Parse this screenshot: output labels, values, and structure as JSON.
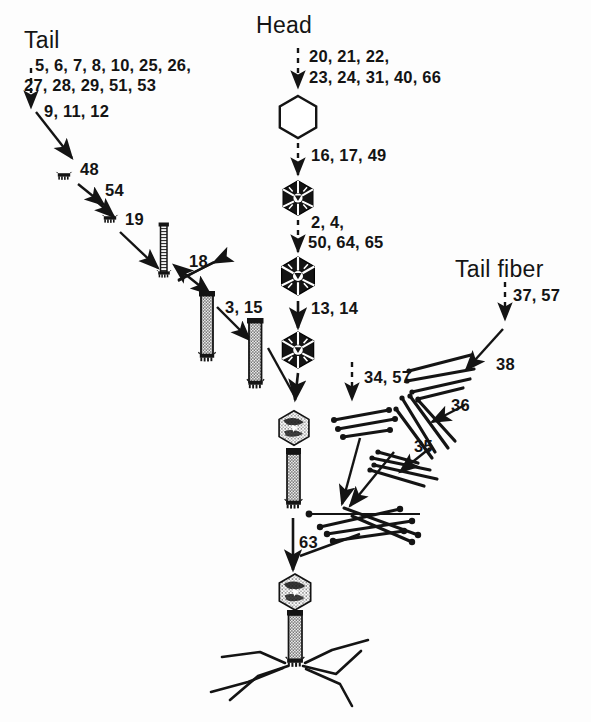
{
  "diagram": {
    "type": "bacteriophage-t4-assembly-pathway",
    "background_color": "#fdfdfd",
    "ink_color": "#141414"
  },
  "headings": {
    "tail": "Tail",
    "head": "Head",
    "tail_fiber": "Tail fiber"
  },
  "pathways": {
    "tail": {
      "step1": "5, 6, 7, 8, 10, 25, 26,",
      "step1b": "27, 28, 29, 51, 53",
      "step2": "9, 11, 12",
      "step3": "48",
      "step4": "54",
      "step5": "19",
      "step6": "18",
      "step7": "3, 15"
    },
    "head": {
      "step1": "20, 21, 22,",
      "step1b": "23, 24, 31, 40, 66",
      "step2": "16, 17, 49",
      "step3": "2, 4,",
      "step3b": "50, 64, 65",
      "step4": "13, 14"
    },
    "tail_fiber": {
      "step1": "37, 57",
      "step2": "38",
      "step3": "36",
      "step4": "35",
      "branch": "34, 57"
    },
    "final": {
      "step1": "63"
    }
  },
  "structures": {
    "prohead": "empty-hexagonal-prohead",
    "head_filled": "dna-filled-capsid",
    "baseplate": "baseplate-icon",
    "tail_tube": "tail-tube-icon",
    "sheathed_tail": "sheathed-tail-icon",
    "head_tail": "head-tail-assembly",
    "complete_phage": "complete-bacteriophage",
    "fiber_bundle": "tail-fiber-bundle"
  }
}
